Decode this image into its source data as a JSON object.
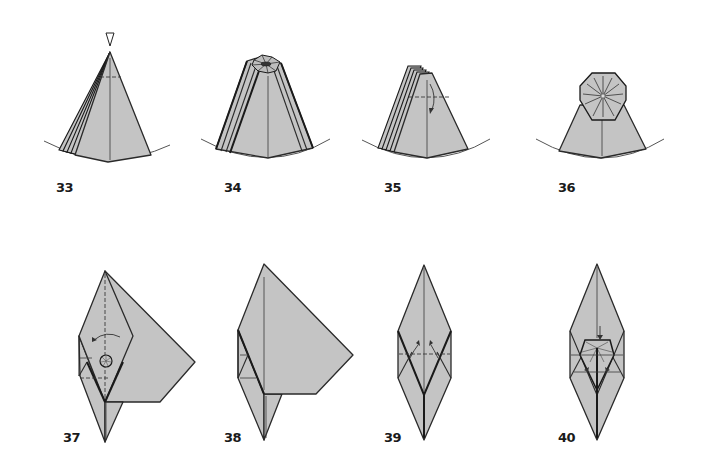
{
  "document": {
    "type": "origami folding diagram sequence",
    "colors": {
      "paper": "#c4c4c4",
      "line": "#2a2a2a",
      "background": "#ffffff"
    },
    "steps": [
      {
        "number": "33",
        "symbols": [
          "push-arrow",
          "valley-fold-line",
          "crease-line",
          "layered-edges"
        ]
      },
      {
        "number": "34",
        "symbols": [
          "collapsed-octagon-top",
          "layered-edges",
          "crease-line"
        ]
      },
      {
        "number": "35",
        "symbols": [
          "valley-fold-line",
          "fold-arrow",
          "crease-line",
          "layered-edges"
        ]
      },
      {
        "number": "36",
        "symbols": [
          "octagon-radial-creases",
          "crease-line"
        ]
      },
      {
        "number": "37",
        "symbols": [
          "rotate-arrow",
          "circle-marker",
          "valley-fold-line",
          "flap"
        ]
      },
      {
        "number": "38",
        "symbols": [
          "flap",
          "crease-line"
        ]
      },
      {
        "number": "39",
        "symbols": [
          "fold-arrows",
          "valley-fold-line",
          "crease-line"
        ]
      },
      {
        "number": "40",
        "symbols": [
          "fold-arrows",
          "push-arrow",
          "crease-lines"
        ]
      }
    ]
  }
}
